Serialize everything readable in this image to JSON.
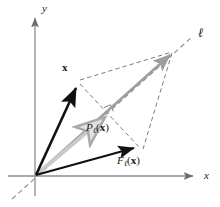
{
  "figure": {
    "background_color": "#ffffff",
    "width": 220,
    "height": 207
  },
  "axes": {
    "x_label": "x",
    "y_label": "y",
    "axis_color": "#8c8c8c",
    "origin": {
      "x": 35,
      "y": 176
    },
    "x_axis": {
      "from_x": 8,
      "to_x": 197,
      "y": 176
    },
    "y_axis": {
      "x": 35,
      "from_y": 196,
      "to_y": 14
    }
  },
  "line_ell": {
    "label": "ℓ",
    "color": "#8a8a8a",
    "style": "dashed",
    "from": {
      "x": 12,
      "y": 199
    },
    "to": {
      "x": 196,
      "y": 34
    }
  },
  "vectors": [
    {
      "name": "x",
      "label": "x",
      "color": "#111111",
      "from": {
        "x": 35,
        "y": 176
      },
      "to": {
        "x": 78,
        "y": 82
      },
      "label_pos": {
        "x": 62,
        "y": 64
      }
    },
    {
      "name": "projection",
      "label": "P",
      "subscript": "ℓ",
      "argument": "x",
      "full_label": "Pℓ(x)",
      "color": "#bdbdbd",
      "from": {
        "x": 35,
        "y": 176
      },
      "to": {
        "x": 110,
        "y": 113
      },
      "label_pos": {
        "x": 86,
        "y": 124
      }
    },
    {
      "name": "reflection",
      "label": "F",
      "subscript": "ℓ",
      "argument": "x",
      "full_label": "Fℓ(x)",
      "color": "#111111",
      "from": {
        "x": 35,
        "y": 176
      },
      "to": {
        "x": 141,
        "y": 148
      },
      "label_pos": {
        "x": 117,
        "y": 157
      }
    },
    {
      "name": "sum-along-ell",
      "color": "#9e9e9e",
      "from": {
        "x": 35,
        "y": 176
      },
      "to": {
        "x": 174,
        "y": 51
      }
    }
  ],
  "construction": {
    "dashed_color": "#7d7d7d",
    "rhombus_vertices": {
      "origin": {
        "x": 35,
        "y": 176
      },
      "x_tip": {
        "x": 78,
        "y": 82
      },
      "ell_tip": {
        "x": 174,
        "y": 51
      },
      "f_tip": {
        "x": 141,
        "y": 148
      }
    },
    "perpendicular_foot": {
      "x": 110,
      "y": 113
    },
    "right_angle_marker": {
      "x": 110,
      "y": 113,
      "size": 7
    }
  },
  "labels": {
    "x_vector": "x",
    "y_axis": "y",
    "x_axis": "x",
    "line": "ℓ",
    "projection_fn": "P",
    "projection_sub": "ℓ",
    "projection_arg": "x",
    "reflection_fn": "F",
    "reflection_sub": "ℓ",
    "reflection_arg": "x",
    "open_paren": "(",
    "close_paren": ")"
  }
}
